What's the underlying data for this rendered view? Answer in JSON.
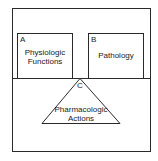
{
  "diagram": {
    "box_a": {
      "letter": "A",
      "line1": "Physiologic",
      "line2": "Functions"
    },
    "box_b": {
      "letter": "B",
      "label": "Pathology"
    },
    "triangle_c": {
      "letter": "C",
      "line1": "Pharmacologic",
      "line2": "Actions"
    },
    "colors": {
      "stroke": "#2a2a2a",
      "background": "#ffffff"
    }
  }
}
